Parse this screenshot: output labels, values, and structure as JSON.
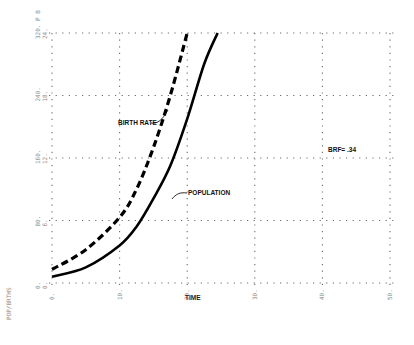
{
  "chart_data": {
    "type": "line",
    "title": "",
    "xlabel": "TIME",
    "ylabel": "POP/BRTHS",
    "xlim": [
      0,
      50
    ],
    "ylim": [
      0,
      320
    ],
    "x_ticks": [
      "0.",
      "10.",
      "20.",
      "30.",
      "40.",
      "50."
    ],
    "y_ticks_primary": [
      "0.",
      "80.",
      "160.",
      "240.",
      "320."
    ],
    "y_ticks_secondary": [
      "0.",
      "6.",
      "12.",
      "18.",
      "24."
    ],
    "y_scale_letters": [
      "P",
      "B"
    ],
    "grid": true,
    "legend": "none (inline annotations)",
    "series": [
      {
        "name": "POPULATION",
        "scale": "P",
        "style": "solid",
        "x": [
          0,
          5,
          10,
          12.5,
          15,
          17.5,
          20,
          22.5,
          24.5
        ],
        "values": [
          8,
          20,
          48,
          72,
          108,
          150,
          210,
          280,
          320
        ]
      },
      {
        "name": "BIRTH RATE",
        "scale": "B",
        "style": "dashed",
        "x": [
          0,
          5,
          10,
          12.5,
          15,
          17.5,
          20
        ],
        "values": [
          1.3,
          3.2,
          6.3,
          9.0,
          13.0,
          18.0,
          24.0
        ]
      }
    ],
    "annotations": [
      "BIRTH RATE",
      "POPULATION",
      "BRF= .34"
    ]
  },
  "labels": {
    "birth_rate": "BIRTH RATE",
    "population": "POPULATION",
    "brf": "BRF= .34",
    "x_axis_title": "TIME",
    "y_axis_title": "POP/BRTHS"
  },
  "colors": {
    "curve": "#000000",
    "grid": "#6a6a6a",
    "tick_text": "#8a8a8a"
  }
}
